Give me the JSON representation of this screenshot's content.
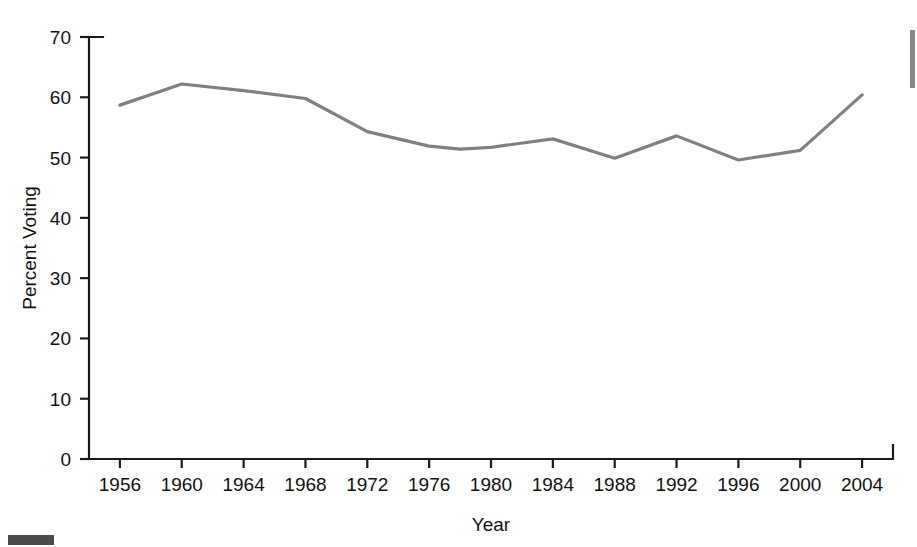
{
  "chart_data": {
    "type": "line",
    "title": "",
    "xlabel": "Year",
    "ylabel": "Percent Voting",
    "xlim": [
      1954,
      2006
    ],
    "ylim": [
      0,
      70
    ],
    "grid": false,
    "legend": "none",
    "x_ticks": [
      1956,
      1960,
      1964,
      1968,
      1972,
      1976,
      1980,
      1984,
      1988,
      1992,
      1996,
      2000,
      2004
    ],
    "y_ticks": [
      0,
      10,
      20,
      30,
      40,
      50,
      60,
      70
    ],
    "line_color": "#808080",
    "axis_color": "#1a1a1a",
    "series": [
      {
        "name": "Percent Voting",
        "x": [
          1956,
          1960,
          1964,
          1968,
          1972,
          1976,
          1978,
          1980,
          1984,
          1988,
          1992,
          1996,
          2000,
          2004
        ],
        "values": [
          58.7,
          62.2,
          61.1,
          59.8,
          54.3,
          51.9,
          51.4,
          51.7,
          53.1,
          49.9,
          53.6,
          49.6,
          51.2,
          60.4
        ]
      }
    ]
  },
  "axis": {
    "x_title": "Year",
    "y_title": "Percent Voting"
  }
}
